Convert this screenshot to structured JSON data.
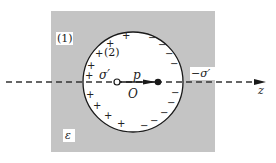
{
  "diagram": {
    "type": "dielectric-sphere-with-dipole",
    "colors": {
      "medium": "#c4c4c4",
      "cavity": "#ffffff",
      "stroke": "#1a1a1a",
      "axis": "#333333"
    },
    "labels": {
      "region_outer": "(1)",
      "region_inner": "(2)",
      "surface_charge_pos": "σ′",
      "surface_charge_neg": "−σ′",
      "dipole_moment": "p",
      "origin": "O",
      "permittivity": "ε",
      "axis": "z"
    },
    "positive_charges": [
      "+",
      "+",
      "+",
      "+",
      "+",
      "+",
      "+",
      "+",
      "+"
    ],
    "negative_charges": [
      "−",
      "−",
      "−",
      "−",
      "−",
      "−",
      "−",
      "−",
      "−"
    ]
  }
}
